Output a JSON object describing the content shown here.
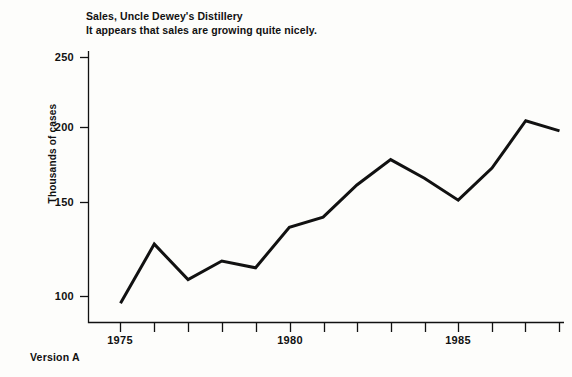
{
  "title": {
    "line1": "Sales, Uncle Dewey's Distillery",
    "line2": "It appears that sales are growing quite nicely."
  },
  "footer": {
    "version": "Version A"
  },
  "chart_data": {
    "type": "line",
    "title": "Sales, Uncle Dewey's Distillery",
    "subtitle": "It appears that sales are growing quite nicely.",
    "xlabel": "",
    "ylabel": "Thousands of cases",
    "x": [
      1975,
      1976,
      1977,
      1978,
      1979,
      1980,
      1981,
      1982,
      1983,
      1984,
      1985,
      1986,
      1987,
      1988
    ],
    "values": [
      96,
      131,
      110,
      121,
      117,
      141,
      147,
      166,
      181,
      170,
      157,
      176,
      204,
      198
    ],
    "series": [
      {
        "name": "Sales",
        "values": [
          96,
          131,
          110,
          121,
          117,
          141,
          147,
          166,
          181,
          170,
          157,
          176,
          204,
          198
        ]
      }
    ],
    "xlim": [
      1974,
      1988
    ],
    "ylim": [
      80,
      250
    ],
    "ytick_labels": [
      "250",
      "200",
      "150",
      "100"
    ],
    "yticks": [
      250,
      200,
      150,
      100
    ],
    "xtick_labels": [
      "1975",
      "1980",
      "1985"
    ],
    "xticks": [
      1975,
      1980,
      1985
    ],
    "xtick_minor": [
      1974,
      1975,
      1976,
      1977,
      1978,
      1979,
      1980,
      1981,
      1982,
      1983,
      1984,
      1985,
      1986,
      1987,
      1988
    ],
    "grid": false,
    "legend": false,
    "line_color": "#111111",
    "background": "#fdfdfb"
  }
}
